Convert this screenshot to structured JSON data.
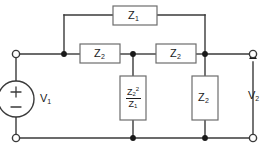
{
  "diagram": {
    "type": "circuit-schematic",
    "colors": {
      "background": "#ffffff",
      "wire": "#3a3a3a",
      "box_stroke": "#6d6d6d",
      "box_fill": "#ffffff",
      "node_fill": "#1a1a1a",
      "text": "#1a1a1a"
    }
  },
  "source": {
    "name": "independent-voltage-source",
    "label": "V",
    "label_sub": "1",
    "plus_sign": "+",
    "minus_sign": "−",
    "polarity": "plus-top"
  },
  "output": {
    "name": "output-port-voltage",
    "label": "V",
    "label_sub": "2",
    "arrow_direction": "up"
  },
  "components": [
    {
      "id": "z1-bridge",
      "name": "bridge-impedance",
      "orientation": "horizontal",
      "label": "Z",
      "sub": "1",
      "sup": ""
    },
    {
      "id": "z2-series-left",
      "name": "series-impedance-left",
      "orientation": "horizontal",
      "label": "Z",
      "sub": "2",
      "sup": ""
    },
    {
      "id": "z2-series-right",
      "name": "series-impedance-right",
      "orientation": "horizontal",
      "label": "Z",
      "sub": "2",
      "sup": ""
    },
    {
      "id": "z2sq-over-z1-shunt",
      "name": "shunt-impedance-middle",
      "orientation": "vertical",
      "numerator_label": "Z",
      "numerator_sub": "2",
      "numerator_sup": "2",
      "denominator_label": "Z",
      "denominator_sub": "1"
    },
    {
      "id": "z2-shunt-right",
      "name": "shunt-impedance-right",
      "orientation": "vertical",
      "label": "Z",
      "sub": "2",
      "sup": ""
    }
  ],
  "terminals": [
    {
      "id": "in-top",
      "name": "input-terminal-top",
      "style": "open-circle"
    },
    {
      "id": "in-bottom",
      "name": "input-terminal-bottom",
      "style": "open-circle"
    },
    {
      "id": "out-top",
      "name": "output-terminal-top",
      "style": "open-circle"
    },
    {
      "id": "out-bottom",
      "name": "output-terminal-bottom",
      "style": "open-circle"
    }
  ],
  "junctions": [
    {
      "id": "node-a",
      "name": "junction-node-a"
    },
    {
      "id": "node-b",
      "name": "junction-node-b"
    },
    {
      "id": "node-c",
      "name": "junction-node-c"
    },
    {
      "id": "node-d",
      "name": "junction-node-d-bottom"
    },
    {
      "id": "node-e",
      "name": "junction-node-e-bottom"
    }
  ]
}
